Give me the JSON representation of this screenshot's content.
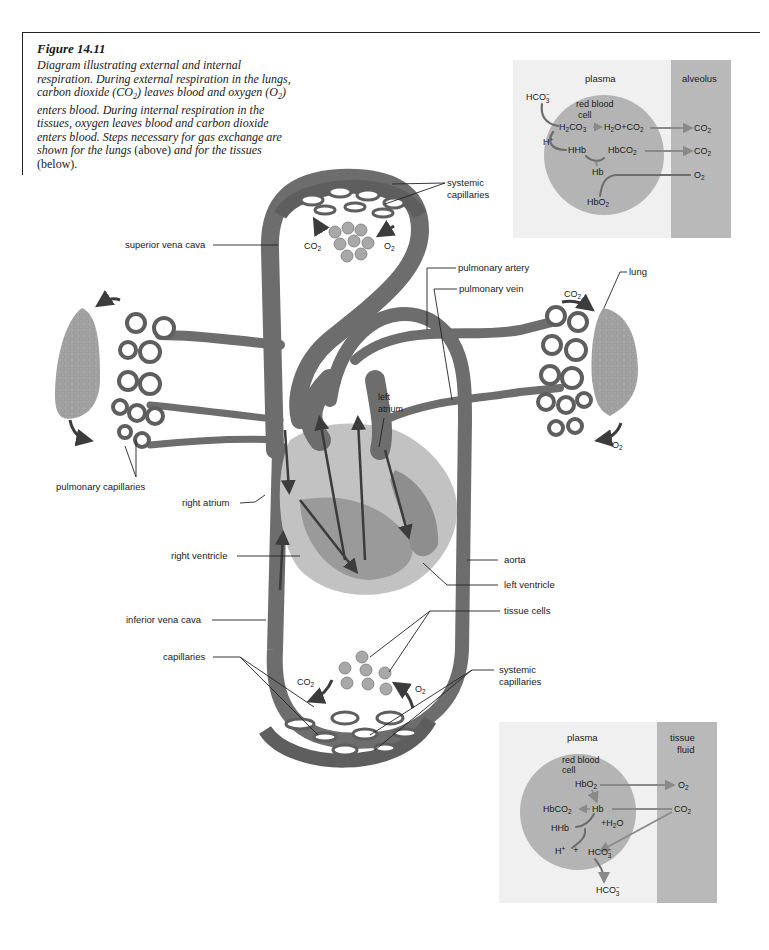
{
  "caption": {
    "figure_number": "Figure 14.11",
    "text_part1": "Diagram illustrating external and internal respiration. During external respiration in the lungs, carbon dioxide (CO",
    "text_part2": ") leaves blood and oxygen (O",
    "text_part3": ") enters blood. During internal respiration in the tissues, oxygen leaves blood and carbon dioxide enters blood. Steps necessary for gas exchange are shown for the lungs ",
    "above": "(above)",
    "text_part4": " and for the tissues ",
    "below": "(below).",
    "subscript_2": "2"
  },
  "labels": {
    "systemic_capillaries_top": [
      "systemic",
      "capillaries"
    ],
    "superior_vena_cava": "superior vena cava",
    "pulmonary_artery": "pulmonary artery",
    "pulmonary_vein": "pulmonary vein",
    "lung": "lung",
    "left_atrium": [
      "left",
      "atrium"
    ],
    "pulmonary_capillaries": "pulmonary capillaries",
    "right_atrium": "right atrium",
    "right_ventricle": "right ventricle",
    "aorta": "aorta",
    "left_ventricle": "left ventricle",
    "inferior_vena_cava": "inferior vena cava",
    "tissue_cells": "tissue cells",
    "capillaries": "capillaries",
    "systemic_capillaries_bottom": [
      "systemic",
      "capillaries"
    ],
    "co2": "CO",
    "o2": "O",
    "sub2": "2"
  },
  "inset_lungs": {
    "plasma_label": "plasma",
    "compartment_label": "alveolus",
    "rbc_label": [
      "red blood",
      "cell"
    ],
    "species": {
      "hco3_in": "HCO",
      "h2co3": "H",
      "h2o_co2": "H",
      "h_plus": "H",
      "hhb": "HHb",
      "hbco2": "HbCO",
      "hb": "Hb",
      "hbo2": "HbO",
      "co2_out_1": "CO",
      "co2_out_2": "CO",
      "o2_in": "O"
    },
    "colors": {
      "plasma": "#f0f0f0",
      "cell": "#b4b4b4",
      "compartment": "#b9b9b9",
      "arrow": "#8a8a8a"
    }
  },
  "inset_tissues": {
    "plasma_label": "plasma",
    "compartment_label": [
      "tissue",
      "fluid"
    ],
    "rbc_label": [
      "red blood",
      "cell"
    ],
    "species": {
      "hbo2": "HbO",
      "o2_out": "O",
      "hbco2": "HbCO",
      "hb": "Hb",
      "co2_in": "CO",
      "hhb": "HHb",
      "h2o": "+H",
      "h_plus": "H",
      "plus": "+",
      "hco3_cell": "HCO",
      "hco3_out": "HCO"
    },
    "colors": {
      "plasma": "#f0f0f0",
      "cell": "#b4b4b4",
      "compartment": "#b9b9b9",
      "arrow": "#8a8a8a"
    }
  },
  "colors": {
    "vessel": "#6b6b6b",
    "vessel_light": "#8c8c8c",
    "heart_outer": "#c2c2c2",
    "heart_inner": "#9a9a9a",
    "lung": "#a5a5a5",
    "arrow": "#3c3c3c"
  }
}
